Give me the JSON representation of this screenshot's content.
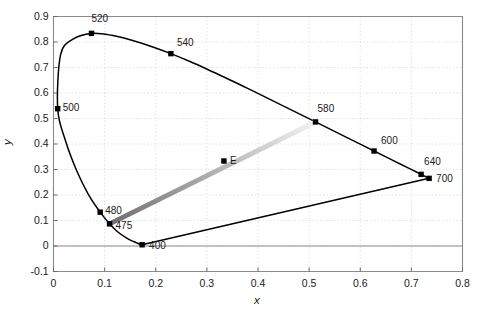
{
  "chart_data": {
    "type": "line",
    "title": "",
    "xlabel": "x",
    "ylabel": "y",
    "xlim": [
      0,
      0.8
    ],
    "ylim": [
      -0.1,
      0.9
    ],
    "grid": true,
    "grid_style": "dotted",
    "legend": "none",
    "xticks": [
      "0",
      "0.1",
      "0.2",
      "0.3",
      "0.4",
      "0.5",
      "0.6",
      "0.7",
      "0.8"
    ],
    "xtick_values": [
      0,
      0.1,
      0.2,
      0.3,
      0.4,
      0.5,
      0.6,
      0.7,
      0.8
    ],
    "yticks": [
      "-0.1",
      "0",
      "0.1",
      "0.2",
      "0.3",
      "0.4",
      "0.5",
      "0.6",
      "0.7",
      "0.8",
      "0.9"
    ],
    "ytick_values": [
      -0.1,
      0,
      0.1,
      0.2,
      0.3,
      0.4,
      0.5,
      0.6,
      0.7,
      0.8,
      0.9
    ],
    "series": [
      {
        "name": "spectral-locus",
        "type": "line",
        "color": "#000000",
        "points": [
          [
            0.1733,
            0.0048
          ],
          [
            0.1714,
            0.0051
          ],
          [
            0.1689,
            0.0069
          ],
          [
            0.1644,
            0.0109
          ],
          [
            0.1566,
            0.0177
          ],
          [
            0.144,
            0.0297
          ],
          [
            0.1241,
            0.0578
          ],
          [
            0.1096,
            0.0868
          ],
          [
            0.0913,
            0.1327
          ],
          [
            0.0687,
            0.2007
          ],
          [
            0.0454,
            0.295
          ],
          [
            0.0235,
            0.4127
          ],
          [
            0.0082,
            0.5384
          ],
          [
            0.0139,
            0.7502
          ],
          [
            0.0389,
            0.812
          ],
          [
            0.0743,
            0.8338
          ],
          [
            0.1142,
            0.8262
          ],
          [
            0.1547,
            0.8059
          ],
          [
            0.1929,
            0.7816
          ],
          [
            0.2296,
            0.7543
          ],
          [
            0.2658,
            0.7243
          ],
          [
            0.3016,
            0.6923
          ],
          [
            0.3373,
            0.6589
          ],
          [
            0.3731,
            0.6245
          ],
          [
            0.4087,
            0.5896
          ],
          [
            0.4441,
            0.5547
          ],
          [
            0.4788,
            0.5202
          ],
          [
            0.5125,
            0.4866
          ],
          [
            0.5448,
            0.4544
          ],
          [
            0.5752,
            0.4242
          ],
          [
            0.6029,
            0.3965
          ],
          [
            0.627,
            0.3725
          ],
          [
            0.6482,
            0.3514
          ],
          [
            0.6658,
            0.334
          ],
          [
            0.6801,
            0.3197
          ],
          [
            0.6915,
            0.3083
          ],
          [
            0.7006,
            0.2993
          ],
          [
            0.7079,
            0.292
          ],
          [
            0.714,
            0.2859
          ],
          [
            0.719,
            0.2809
          ],
          [
            0.723,
            0.277
          ],
          [
            0.726,
            0.274
          ],
          [
            0.7283,
            0.2717
          ],
          [
            0.73,
            0.27
          ],
          [
            0.7334,
            0.2666
          ]
        ]
      },
      {
        "name": "purple-line",
        "type": "line",
        "color": "#000000",
        "points": [
          [
            0.1733,
            0.0048
          ],
          [
            0.7347,
            0.2653
          ]
        ]
      },
      {
        "name": "mix-line-475-580",
        "type": "line-gradient",
        "gradient_from": "#6e6e6e",
        "gradient_to": "#f2f2f2",
        "points": [
          [
            0.1096,
            0.0868
          ],
          [
            0.5125,
            0.4866
          ]
        ]
      }
    ],
    "markers": [
      {
        "label": "400",
        "x": 0.1733,
        "y": 0.0048,
        "label_dx": 7,
        "label_dy": 1
      },
      {
        "label": "475",
        "x": 0.1096,
        "y": 0.0868,
        "label_dx": 6,
        "label_dy": 2
      },
      {
        "label": "480",
        "x": 0.0913,
        "y": 0.1327,
        "label_dx": 5,
        "label_dy": -1
      },
      {
        "label": "500",
        "x": 0.0082,
        "y": 0.5384,
        "label_dx": 5,
        "label_dy": -1
      },
      {
        "label": "520",
        "x": 0.0743,
        "y": 0.8338,
        "label_dx": 0,
        "label_dy": -14
      },
      {
        "label": "540",
        "x": 0.2296,
        "y": 0.7543,
        "label_dx": 6,
        "label_dy": -11
      },
      {
        "label": "580",
        "x": 0.5125,
        "y": 0.4866,
        "label_dx": 2,
        "label_dy": -13
      },
      {
        "label": "600",
        "x": 0.627,
        "y": 0.3725,
        "label_dx": 7,
        "label_dy": -10
      },
      {
        "label": "640",
        "x": 0.719,
        "y": 0.2809,
        "label_dx": 3,
        "label_dy": -12
      },
      {
        "label": "700",
        "x": 0.7347,
        "y": 0.2653,
        "label_dx": 7,
        "label_dy": 1
      },
      {
        "label": "E",
        "x": 0.3333,
        "y": 0.3333,
        "label_dx": 6,
        "label_dy": 0
      }
    ]
  }
}
